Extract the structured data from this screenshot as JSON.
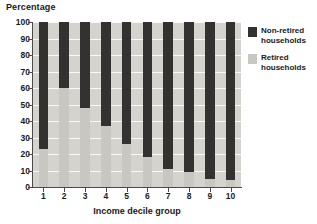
{
  "chart_data": {
    "type": "bar",
    "subtype": "stacked-100-percent",
    "title": "",
    "ylabel": "Percentage",
    "xlabel": "Income decile group",
    "ylim": [
      0,
      100
    ],
    "yticks": [
      0,
      10,
      20,
      30,
      40,
      50,
      60,
      70,
      80,
      90,
      100
    ],
    "ytick_labels": [
      "0",
      "10",
      "20",
      "30",
      "40",
      "50",
      "60",
      "70",
      "80",
      "90",
      "100"
    ],
    "categories": [
      "1",
      "2",
      "3",
      "4",
      "5",
      "6",
      "7",
      "8",
      "9",
      "10"
    ],
    "grid": true,
    "legend_position": "right",
    "series": [
      {
        "name": "Non-retired households",
        "color": "#333230",
        "values": [
          77,
          40,
          52,
          63,
          74,
          82,
          89,
          91,
          95,
          96
        ]
      },
      {
        "name": "Retired households",
        "color": "#c9c7c2",
        "values": [
          23,
          60,
          48,
          37,
          26,
          18,
          11,
          9,
          5,
          4
        ]
      }
    ]
  },
  "legend": {
    "items": [
      {
        "label_line1": "Non-retired",
        "label_line2": "households",
        "color": "#333230"
      },
      {
        "label_line1": "Retired",
        "label_line2": "households",
        "color": "#c9c7c2"
      }
    ]
  },
  "axes": {
    "y_title": "Percentage",
    "x_title": "Income decile group"
  },
  "colors": {
    "plot_background": "#d5d3ce",
    "gridline": "#ffffff",
    "axis": "#4a4a4a",
    "non_retired": "#333230",
    "retired": "#c9c7c2",
    "text": "#1a1a1a"
  }
}
